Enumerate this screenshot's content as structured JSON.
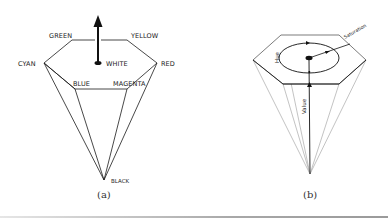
{
  "figure_a": {
    "caption": "(a)",
    "title": "HSV hexcone with color vertices",
    "labels": {
      "green": "GREEN",
      "yellow": "YELLOW",
      "cyan": "CYAN",
      "red": "RED",
      "white": "WHITE",
      "blue": "BLUE",
      "magenta": "MAGENTA",
      "black": "BLACK"
    }
  },
  "figure_b": {
    "caption": "(b)",
    "title": "HSV hexcone with hue, saturation, value axes",
    "labels": {
      "hue": "Hue",
      "saturation": "Saturation",
      "value": "Value"
    }
  },
  "colors": {
    "stroke_dark": "#1a1a1a",
    "stroke_light": "#9a9a9a",
    "text": "#222222"
  }
}
